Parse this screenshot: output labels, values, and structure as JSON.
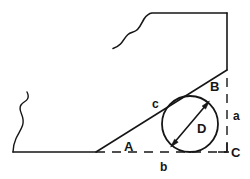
{
  "figure": {
    "stroke_color": "#161616",
    "background_color": "#ffffff",
    "labels": {
      "angle_a": "A",
      "angle_b": "B",
      "angle_c": "C",
      "side_a": "a",
      "side_b": "b",
      "side_c": "c",
      "diameter": "D"
    },
    "geometry": {
      "circle": {
        "center_x": 190,
        "center_y": 124,
        "radius": 28
      },
      "diameter_arrow": {
        "x1": 172,
        "y1": 145,
        "x2": 208,
        "y2": 103
      },
      "baseline": {
        "solid_from_x": 13,
        "solid_to_x": 96,
        "dashed_from_x": 96,
        "dashed_to_x": 229,
        "y": 152
      },
      "vertical_dashed": {
        "x": 227,
        "from_y": 78,
        "to_y": 152
      },
      "chamfer_line": {
        "x1": 96,
        "y1": 152,
        "x2": 227,
        "y2": 70
      },
      "right_edge": {
        "x": 227,
        "from_y": 13,
        "to_y": 70
      },
      "top_edge": {
        "from_x": 148,
        "to_x": 227,
        "y": 13
      }
    }
  }
}
